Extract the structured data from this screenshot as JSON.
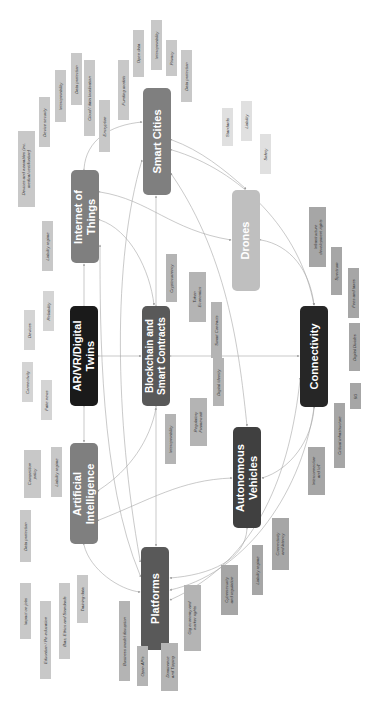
{
  "diagram": {
    "orientation": "rotated 90 degrees counter-clockwise",
    "nodes": [
      {
        "id": "smart-cities",
        "label": "Smart Cities",
        "color": "#7f7f7f",
        "box": [
          143,
          88,
          28,
          107
        ]
      },
      {
        "id": "iot",
        "label": "Internet of\nThings",
        "color": "#7f7f7f",
        "box": [
          71,
          170,
          28,
          93
        ]
      },
      {
        "id": "drones",
        "label": "Drones",
        "color": "#bfbfbf",
        "box": [
          232,
          190,
          28,
          101
        ]
      },
      {
        "id": "ar-vr",
        "label": "AR/VR/Digital\nTwins",
        "color": "#1a1a1a",
        "box": [
          70,
          306,
          28,
          100
        ]
      },
      {
        "id": "blockchain",
        "label": "Blockchain and\nSmart Contracts",
        "color": "#595959",
        "box": [
          142,
          306,
          28,
          100
        ]
      },
      {
        "id": "connectivity",
        "label": "Connectivity",
        "color": "#262626",
        "box": [
          300,
          306,
          28,
          101
        ]
      },
      {
        "id": "ai",
        "label": "Artificial\nIntelligence",
        "color": "#7f7f7f",
        "box": [
          70,
          443,
          28,
          101
        ]
      },
      {
        "id": "av",
        "label": "Autonomous\nVehicles",
        "color": "#404040",
        "box": [
          233,
          427,
          28,
          101
        ]
      },
      {
        "id": "platforms",
        "label": "Platforms",
        "color": "#595959",
        "box": [
          141,
          547,
          28,
          103
        ]
      }
    ],
    "tags": [
      {
        "label": "Encryption",
        "box": [
          99,
          100,
          11,
          52
        ]
      },
      {
        "label": "Cloud / data localisation",
        "box": [
          84,
          60,
          11,
          76
        ]
      },
      {
        "label": "Data protection",
        "box": [
          71,
          53,
          11,
          52
        ]
      },
      {
        "label": "Interoperability",
        "box": [
          55,
          70,
          11,
          52
        ]
      },
      {
        "label": "Device security",
        "box": [
          39,
          97,
          11,
          50
        ]
      },
      {
        "label": "Devices and wearables (inc.\nmedical certification)",
        "box": [
          18,
          131,
          17,
          76
        ]
      },
      {
        "label": "Liability regime",
        "box": [
          42,
          221,
          11,
          50
        ]
      },
      {
        "label": "Reliability",
        "box": [
          43,
          291,
          11,
          40
        ]
      },
      {
        "label": "Devices",
        "box": [
          24,
          310,
          11,
          40
        ]
      },
      {
        "label": "Funding models",
        "box": [
          118,
          60,
          11,
          60
        ]
      },
      {
        "label": "Open data",
        "box": [
          133,
          30,
          11,
          47
        ]
      },
      {
        "label": "Interoperability",
        "box": [
          151,
          20,
          11,
          50
        ]
      },
      {
        "label": "Privacy",
        "box": [
          166,
          40,
          11,
          36
        ]
      },
      {
        "label": "Data protection",
        "box": [
          181,
          50,
          11,
          52
        ]
      },
      {
        "label": "Standards",
        "box": [
          222,
          108,
          11,
          38
        ]
      },
      {
        "label": "Liability",
        "box": [
          241,
          101,
          11,
          40
        ]
      },
      {
        "label": "Safety",
        "box": [
          260,
          134,
          11,
          40
        ]
      },
      {
        "label": "Cryptocurrency",
        "box": [
          166,
          254,
          11,
          48
        ]
      },
      {
        "label": "Token\nEconomics",
        "box": [
          189,
          272,
          17,
          50
        ]
      },
      {
        "label": "Smart Contracts",
        "box": [
          211,
          302,
          11,
          56
        ]
      },
      {
        "label": "Digital Identity",
        "box": [
          213,
          358,
          11,
          48
        ]
      },
      {
        "label": "Regulatory\nFramework",
        "box": [
          190,
          398,
          17,
          48
        ]
      },
      {
        "label": "Interoperability",
        "box": [
          165,
          414,
          11,
          50
        ]
      },
      {
        "label": "Infrastructure\ndevelopment rights",
        "box": [
          309,
          207,
          17,
          60
        ]
      },
      {
        "label": "Spectrum",
        "box": [
          331,
          247,
          11,
          48
        ]
      },
      {
        "label": "Fees and taxes",
        "box": [
          348,
          268,
          11,
          50
        ]
      },
      {
        "label": "Digital Divides",
        "box": [
          349,
          323,
          11,
          48
        ]
      },
      {
        "label": "5G",
        "box": [
          350,
          383,
          11,
          26
        ]
      },
      {
        "label": "Critical infrastructure",
        "box": [
          334,
          403,
          11,
          65
        ]
      },
      {
        "label": "Interconnection\nand IoT",
        "box": [
          308,
          447,
          17,
          48
        ]
      },
      {
        "label": "Connectivity\nand latency",
        "box": [
          272,
          518,
          17,
          52
        ]
      },
      {
        "label": "Liability regime",
        "box": [
          252,
          545,
          11,
          50
        ]
      },
      {
        "label": "Cybersecurity\nand regulation",
        "box": [
          221,
          565,
          17,
          50
        ]
      },
      {
        "label": "Gig economy and\nworker rights",
        "box": [
          184,
          585,
          17,
          66
        ]
      },
      {
        "label": "Dominance\nand Tipping",
        "box": [
          161,
          643,
          17,
          48
        ]
      },
      {
        "label": "Open APIs",
        "box": [
          137,
          646,
          11,
          40
        ]
      },
      {
        "label": "Business model disruption",
        "box": [
          119,
          601,
          11,
          80
        ]
      },
      {
        "label": "Competition\npolicy",
        "box": [
          24,
          450,
          17,
          48
        ]
      },
      {
        "label": "Liability regime",
        "box": [
          51,
          447,
          11,
          50
        ]
      },
      {
        "label": "Fake news",
        "box": [
          41,
          380,
          11,
          40
        ]
      },
      {
        "label": "Connectivity",
        "box": [
          22,
          362,
          11,
          40
        ]
      },
      {
        "label": "Data protection",
        "box": [
          20,
          510,
          11,
          52
        ]
      },
      {
        "label": "Training data",
        "box": [
          77,
          575,
          11,
          48
        ]
      },
      {
        "label": "Bias, Ethics and Standards",
        "box": [
          59,
          583,
          11,
          76
        ]
      },
      {
        "label": "Education / Re-education",
        "box": [
          40,
          601,
          11,
          78
        ]
      },
      {
        "label": "Impact on jobs",
        "box": [
          20,
          583,
          11,
          56
        ]
      }
    ],
    "links": [
      "AR/VR/Digital Twins <-> Internet of Things",
      "AR/VR/Digital Twins <-> Artificial Intelligence",
      "AR/VR/Digital Twins <-> Blockchain and Smart Contracts",
      "Blockchain and Smart Contracts <-> Connectivity",
      "Blockchain and Smart Contracts <-> Smart Cities",
      "Blockchain and Smart Contracts <-> Platforms",
      "Blockchain and Smart Contracts <-> Internet of Things",
      "Internet of Things <-> Smart Cities",
      "Internet of Things <-> Connectivity",
      "Smart Cities <-> Drones",
      "Smart Cities <-> Connectivity",
      "Smart Cities <-> Autonomous Vehicles",
      "Drones <-> Connectivity",
      "Drones <-> Internet of Things",
      "Connectivity <-> Autonomous Vehicles",
      "Connectivity <-> Platforms",
      "Artificial Intelligence <-> Platforms",
      "Artificial Intelligence <-> Autonomous Vehicles",
      "Artificial Intelligence <-> Blockchain and Smart Contracts",
      "Autonomous Vehicles <-> Platforms",
      "Platforms <-> Smart Cities",
      "Platforms <-> Internet of Things"
    ]
  }
}
